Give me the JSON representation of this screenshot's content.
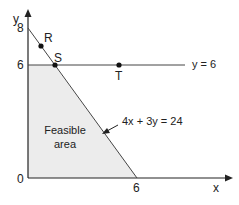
{
  "diagram": {
    "type": "linear-programming-graph",
    "axes": {
      "x_label": "x",
      "y_label": "y",
      "origin_label": "0",
      "x_ticks": [
        "6"
      ],
      "y_ticks": [
        "8",
        "6"
      ]
    },
    "lines": [
      {
        "label": "y = 6",
        "equation": "y = 6"
      },
      {
        "label": "4x + 3y = 24",
        "equation": "4x + 3y = 24"
      }
    ],
    "points": [
      {
        "label": "R",
        "x": 0.75,
        "y": 7
      },
      {
        "label": "S",
        "x": 1.5,
        "y": 6
      },
      {
        "label": "T",
        "x": 5,
        "y": 6
      }
    ],
    "region": {
      "label_line1": "Feasible",
      "label_line2": "area",
      "fill": "#ececec"
    },
    "colors": {
      "line": "#333333",
      "axis": "#222222",
      "point": "#111111"
    }
  }
}
